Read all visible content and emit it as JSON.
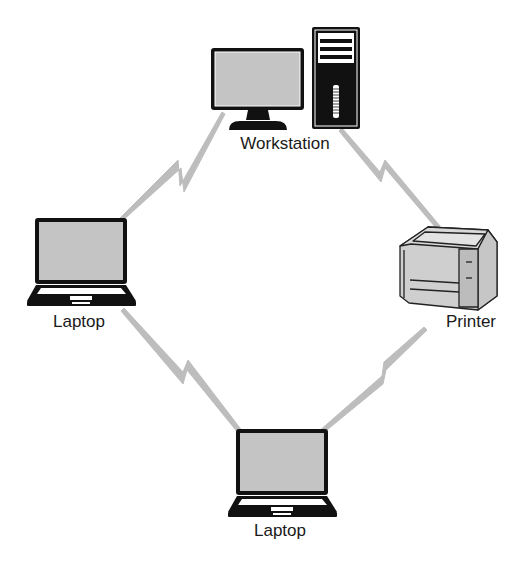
{
  "diagram": {
    "type": "network-topology",
    "colors": {
      "device_outline": "#111111",
      "screen_fill": "#c4c4c4",
      "link": "#bdbdbd",
      "printer_body": "#cfcfcf",
      "label": "#1a1a1a",
      "background": "#ffffff"
    },
    "nodes": [
      {
        "id": "workstation",
        "label": "Workstation",
        "icon": "desktop-computer-icon",
        "x": 285,
        "y": 144
      },
      {
        "id": "printer",
        "label": "Printer",
        "icon": "printer-icon",
        "x": 471,
        "y": 322
      },
      {
        "id": "laptop_left",
        "label": "Laptop",
        "icon": "laptop-icon",
        "x": 79,
        "y": 322
      },
      {
        "id": "laptop_bottom",
        "label": "Laptop",
        "icon": "laptop-icon",
        "x": 280,
        "y": 531
      }
    ],
    "links": [
      {
        "from": "laptop_left",
        "to": "workstation",
        "style": "wireless-lightning"
      },
      {
        "from": "workstation",
        "to": "printer",
        "style": "wireless-lightning"
      },
      {
        "from": "laptop_left",
        "to": "laptop_bottom",
        "style": "wireless-lightning"
      },
      {
        "from": "printer",
        "to": "laptop_bottom",
        "style": "wireless-lightning"
      }
    ]
  }
}
